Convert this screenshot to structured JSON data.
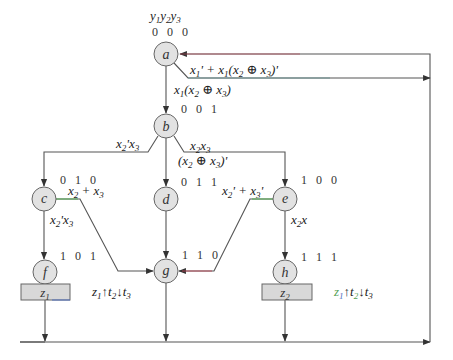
{
  "diagram": {
    "type": "ASM chart / state diagram",
    "state_var_header": "y1y2y3",
    "states": [
      {
        "id": "a",
        "code": "0 0 0",
        "cx": 166,
        "cy": 54
      },
      {
        "id": "b",
        "code": "0 0 1",
        "cx": 166,
        "cy": 126
      },
      {
        "id": "c",
        "code": "0 1 0",
        "cx": 44,
        "cy": 199
      },
      {
        "id": "d",
        "code": "0 1 1",
        "cx": 166,
        "cy": 199
      },
      {
        "id": "e",
        "code": "1 0 0",
        "cx": 285,
        "cy": 199
      },
      {
        "id": "f",
        "code": "1 0 1",
        "cx": 45,
        "cy": 272
      },
      {
        "id": "g",
        "code": "1 1 0",
        "cx": 166,
        "cy": 271
      },
      {
        "id": "h",
        "code": "1 1 1",
        "cx": 285,
        "cy": 272
      }
    ],
    "outputs": [
      {
        "state": "f",
        "label": "z1"
      },
      {
        "state": "h",
        "label": "z2"
      }
    ],
    "transitions": [
      {
        "from": "a",
        "to": "a",
        "condition": "x1' + x1(x2 ⊕ x3)'"
      },
      {
        "from": "a",
        "to": "b",
        "condition": "x1(x2 ⊕ x3)"
      },
      {
        "from": "b",
        "to": "c",
        "condition": "x2'x3"
      },
      {
        "from": "b",
        "to": "d",
        "condition": "(x2 ⊕ x3)'"
      },
      {
        "from": "b",
        "to": "e",
        "condition": "x2x3"
      },
      {
        "from": "c",
        "to": "g",
        "condition": "x2 + x3"
      },
      {
        "from": "c",
        "to": "f",
        "condition": "x2'x3"
      },
      {
        "from": "d",
        "to": "g",
        "condition": ""
      },
      {
        "from": "e",
        "to": "g",
        "condition": "x2' + x3'"
      },
      {
        "from": "e",
        "to": "h",
        "condition": "x2x"
      },
      {
        "from": "f",
        "to": "a",
        "condition": ""
      },
      {
        "from": "g",
        "to": "a",
        "condition": ""
      },
      {
        "from": "h",
        "to": "a",
        "condition": ""
      }
    ],
    "annotations": [
      {
        "near": "g",
        "text": "z1↑t2↓t3"
      },
      {
        "near": "h",
        "text": "z1↑t2↓t3"
      }
    ],
    "colors": {
      "line": "#555555",
      "node_fill": "#e2e2e2",
      "node_stroke": "#666666",
      "output_box_fill": "#d8d8d8",
      "accent_green": "#55b055",
      "accent_red": "#c04050",
      "accent_blue": "#5070c0"
    }
  }
}
